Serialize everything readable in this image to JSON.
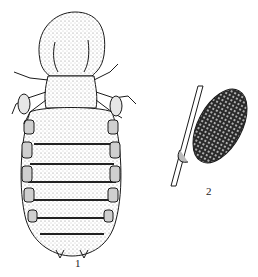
{
  "figures": [
    {
      "id": 1,
      "label": "1",
      "subject": "louse-dorsal-view"
    },
    {
      "id": 2,
      "label": "2",
      "subject": "egg-attached-to-hair"
    }
  ],
  "colors": {
    "ink": "#1a1a1a",
    "background": "#ffffff",
    "stipple": "#555555"
  }
}
